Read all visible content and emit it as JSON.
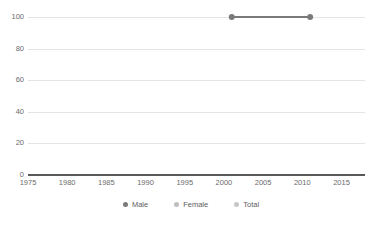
{
  "chart_data": {
    "type": "line",
    "title": "",
    "subtitle": "",
    "xlabel": "",
    "ylabel": "",
    "xlim": [
      1975,
      2018
    ],
    "ylim": [
      0,
      100
    ],
    "xticks": [
      1975,
      1980,
      1985,
      1990,
      1995,
      2000,
      2005,
      2010,
      2015
    ],
    "yticks": [
      0,
      20,
      40,
      60,
      80,
      100
    ],
    "grid": true,
    "legend_position": "bottom",
    "series": [
      {
        "name": "Male",
        "color": "#7a7a7a",
        "x": [
          2001,
          2011
        ],
        "values": [
          100,
          100
        ]
      },
      {
        "name": "Female",
        "color": "#bdbdbd",
        "x": [],
        "values": []
      },
      {
        "name": "Total",
        "color": "#c6c6c6",
        "x": [],
        "values": []
      }
    ]
  },
  "axes": {
    "x_tick_labels": [
      "1975",
      "1980",
      "1985",
      "1990",
      "1995",
      "2000",
      "2005",
      "2010",
      "2015"
    ],
    "y_tick_labels": [
      "100",
      "80",
      "60",
      "40",
      "20",
      "0"
    ]
  },
  "legend": {
    "items": [
      {
        "label": "Male",
        "color": "#7a7a7a"
      },
      {
        "label": "Female",
        "color": "#bdbdbd"
      },
      {
        "label": "Total",
        "color": "#c6c6c6"
      }
    ]
  },
  "style": {
    "grid_color": "#e4e4e4",
    "axis_color": "#58595b",
    "tick_text_color": "#6b6b6b",
    "background": "#ffffff"
  }
}
